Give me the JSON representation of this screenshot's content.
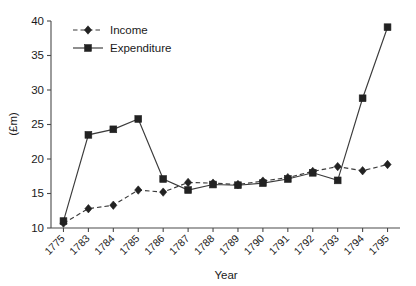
{
  "chart_data": {
    "type": "line",
    "title": "",
    "xlabel": "Year",
    "ylabel": "(£m)",
    "categories": [
      "1775",
      "1783",
      "1784",
      "1785",
      "1786",
      "1787",
      "1788",
      "1789",
      "1790",
      "1791",
      "1792",
      "1793",
      "1794",
      "1795"
    ],
    "ylim": [
      10,
      40
    ],
    "yticks": [
      10,
      15,
      20,
      25,
      30,
      35,
      40
    ],
    "ytick_labels": [
      "10",
      "15",
      "20",
      "25",
      "30",
      "35",
      "40"
    ],
    "grid": false,
    "legend_position": "top-left",
    "series": [
      {
        "name": "Income",
        "marker": "diamond",
        "line_style": "dashed",
        "color": "#222222",
        "values": [
          10.7,
          12.8,
          13.3,
          15.5,
          15.2,
          16.6,
          16.5,
          16.3,
          16.8,
          17.3,
          18.2,
          18.9,
          18.3,
          19.2
        ]
      },
      {
        "name": "Expenditure",
        "marker": "square",
        "line_style": "solid",
        "color": "#222222",
        "values": [
          11.0,
          23.5,
          24.3,
          25.8,
          17.1,
          15.5,
          16.3,
          16.2,
          16.5,
          17.1,
          18.0,
          16.9,
          28.8,
          39.1
        ]
      }
    ]
  },
  "legend": {
    "items": [
      {
        "label": "Income"
      },
      {
        "label": "Expenditure"
      }
    ]
  }
}
